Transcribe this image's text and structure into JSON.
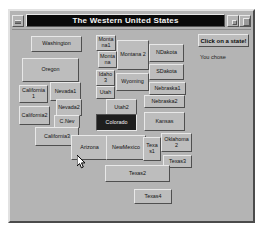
{
  "window": {
    "title": "The Western United States",
    "controls": {
      "menu": "window-menu",
      "minimize": "minimize",
      "maximize": "maximize"
    }
  },
  "panel": {
    "prompt": "Click on a state!",
    "chose_label": "You chose"
  },
  "map": {
    "states": [
      {
        "label": "Washington",
        "x": 13,
        "y": 2,
        "w": 51,
        "h": 16,
        "pressed": false
      },
      {
        "label": "Montana1",
        "x": 78,
        "y": 1,
        "w": 20,
        "h": 16,
        "pressed": false
      },
      {
        "label": "Montana",
        "x": 80,
        "y": 17,
        "w": 19,
        "h": 17,
        "pressed": false
      },
      {
        "label": "Montana 2",
        "x": 99,
        "y": 6,
        "w": 32,
        "h": 30,
        "pressed": false
      },
      {
        "label": "NDakota",
        "x": 131,
        "y": 10,
        "w": 35,
        "h": 18,
        "pressed": false
      },
      {
        "label": "Oregon",
        "x": 4,
        "y": 24,
        "w": 57,
        "h": 24,
        "pressed": false
      },
      {
        "label": "Idaho3",
        "x": 78,
        "y": 36,
        "w": 19,
        "h": 16,
        "pressed": false
      },
      {
        "label": "SDakota",
        "x": 131,
        "y": 30,
        "w": 35,
        "h": 16,
        "pressed": false
      },
      {
        "label": "Wyoming",
        "x": 98,
        "y": 39,
        "w": 33,
        "h": 18,
        "pressed": false
      },
      {
        "label": "Utah",
        "x": 78,
        "y": 52,
        "w": 19,
        "h": 13,
        "pressed": false
      },
      {
        "label": "Nebraska1",
        "x": 131,
        "y": 48,
        "w": 37,
        "h": 13,
        "pressed": false
      },
      {
        "label": "California1",
        "x": 1,
        "y": 51,
        "w": 29,
        "h": 18,
        "pressed": false
      },
      {
        "label": "Nevada1",
        "x": 32,
        "y": 48,
        "w": 31,
        "h": 19,
        "pressed": false
      },
      {
        "label": "Utah2",
        "x": 88,
        "y": 65,
        "w": 31,
        "h": 17,
        "pressed": false
      },
      {
        "label": "Nevada2",
        "x": 38,
        "y": 65,
        "w": 26,
        "h": 17,
        "pressed": false
      },
      {
        "label": "Nebraska2",
        "x": 126,
        "y": 61,
        "w": 41,
        "h": 13,
        "pressed": false
      },
      {
        "label": "California2",
        "x": 1,
        "y": 72,
        "w": 31,
        "h": 19,
        "pressed": false
      },
      {
        "label": "C.Nev",
        "x": 36,
        "y": 81,
        "w": 26,
        "h": 13,
        "pressed": false
      },
      {
        "label": "Colorado",
        "x": 78,
        "y": 80,
        "w": 41,
        "h": 17,
        "pressed": true
      },
      {
        "label": "Kansas",
        "x": 126,
        "y": 78,
        "w": 41,
        "h": 19,
        "pressed": false
      },
      {
        "label": "California3",
        "x": 17,
        "y": 93,
        "w": 44,
        "h": 19,
        "pressed": false
      },
      {
        "label": "Arizona",
        "x": 53,
        "y": 101,
        "w": 37,
        "h": 25,
        "pressed": false
      },
      {
        "label": "NewMexico",
        "x": 88,
        "y": 101,
        "w": 40,
        "h": 25,
        "pressed": false
      },
      {
        "label": "Texas1",
        "x": 125,
        "y": 103,
        "w": 18,
        "h": 24,
        "pressed": false
      },
      {
        "label": "Oklahoma2",
        "x": 143,
        "y": 99,
        "w": 31,
        "h": 19,
        "pressed": false
      },
      {
        "label": "Texas3",
        "x": 145,
        "y": 121,
        "w": 29,
        "h": 13,
        "pressed": false
      },
      {
        "label": "Texas2",
        "x": 87,
        "y": 131,
        "w": 65,
        "h": 17,
        "pressed": false
      },
      {
        "label": "Texas4",
        "x": 116,
        "y": 155,
        "w": 38,
        "h": 15,
        "pressed": false
      }
    ]
  }
}
